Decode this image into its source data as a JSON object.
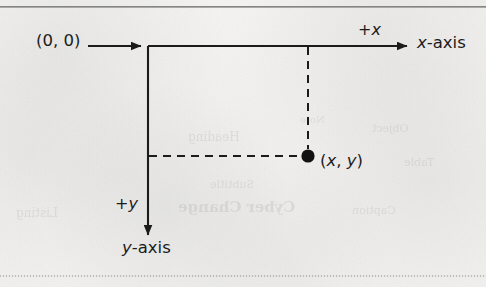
{
  "figure": {
    "background_color": "#f1f0ee",
    "ink_color": "#1b1b1b"
  },
  "rules": {
    "top": "horizontal-rule-top",
    "bottom": "horizontal-rule-bottom"
  },
  "diagram": {
    "origin_label": "(0, 0)",
    "positive_x_label_prefix": "+",
    "positive_x_label_var": "x",
    "positive_y_label_prefix": "+",
    "positive_y_label_var": "y",
    "x_axis_label_var": "x",
    "x_axis_label_suffix": "-axis",
    "y_axis_label_var": "y",
    "y_axis_label_suffix": "-axis",
    "point_label_open": "(",
    "point_label_x": "x",
    "point_label_comma": ", ",
    "point_label_y": "y",
    "point_label_close": ")"
  },
  "geometry": {
    "origin_x": 148,
    "origin_y": 46,
    "x_axis_end_x": 410,
    "y_axis_end_y": 238,
    "point_x": 308,
    "point_y": 156,
    "point_radius": 6.5,
    "pointer_arrow_start_x": 88,
    "pointer_arrow_end_x": 143,
    "pointer_arrow_y": 46
  },
  "bleed_through": {
    "items": [
      {
        "text": "Cyber Change",
        "left": 178,
        "top": 198,
        "size": 15,
        "weight": "bold"
      },
      {
        "text": "Subtitle",
        "left": 210,
        "top": 178,
        "size": 11,
        "weight": "normal"
      },
      {
        "text": "Heading",
        "left": 188,
        "top": 130,
        "size": 12,
        "weight": "normal"
      },
      {
        "text": "Caption",
        "left": 352,
        "top": 204,
        "size": 11,
        "weight": "normal"
      },
      {
        "text": "Object",
        "left": 372,
        "top": 122,
        "size": 11,
        "weight": "normal"
      },
      {
        "text": "Listing",
        "left": 16,
        "top": 206,
        "size": 12,
        "weight": "normal"
      },
      {
        "text": "Table",
        "left": 404,
        "top": 156,
        "size": 11,
        "weight": "normal"
      },
      {
        "text": "Note",
        "left": 300,
        "top": 114,
        "size": 10,
        "weight": "normal"
      }
    ]
  }
}
